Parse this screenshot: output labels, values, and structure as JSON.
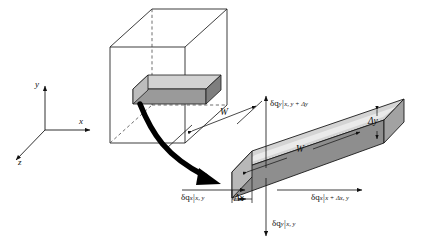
{
  "figure": {
    "type": "technical-diagram",
    "background_color": "#ffffff",
    "line_color": "#1a1a1a",
    "views": [
      {
        "id": "overview",
        "description": "Wireframe rectangular enclosure containing a small shaded rectangular bar, with hidden edges dashed"
      },
      {
        "id": "detail",
        "description": "Enlarged isometric view of the rectangular bar element with heat flux arrows on all four faces"
      }
    ]
  },
  "axes": {
    "name": "coordinate-triad",
    "x_label": "x",
    "y_label": "y",
    "z_label": "z"
  },
  "overview": {
    "width_label": "W",
    "box_label": "",
    "bar_label": ""
  },
  "detail": {
    "length_label": "W",
    "thickness_label": "Δy",
    "width_label": "Δx"
  },
  "fluxes": [
    {
      "id": "flux-y-top",
      "symbol": "δq",
      "component": "y",
      "bar": "|",
      "subscript": "x, y + Δy",
      "full": "δq_y|_{x, y + Δy}",
      "direction": "up",
      "face": "top"
    },
    {
      "id": "flux-x-left",
      "symbol": "δq",
      "component": "x",
      "bar": "|",
      "subscript": "x, y",
      "full": "δq_x|_{x, y}",
      "direction": "right",
      "face": "left"
    },
    {
      "id": "flux-x-right",
      "symbol": "δq",
      "component": "x",
      "bar": "|",
      "subscript": "x + Δx, y",
      "full": "δq_x|_{x + Δx, y}",
      "direction": "right",
      "face": "right"
    },
    {
      "id": "flux-y-bottom",
      "symbol": "δq",
      "component": "y",
      "bar": "|",
      "subscript": "x, y",
      "full": "δq_y|_{x, y}",
      "direction": "down",
      "face": "bottom"
    }
  ],
  "colors": {
    "bar_front": "#8e8e8e",
    "bar_top": "#cfcfcf",
    "bar_end": "#b5b5b5",
    "bar_side_light": "#d8d8d8",
    "outline": "#1a1a1a",
    "dashed": "#5a5a5a",
    "arrow": "#000000"
  }
}
